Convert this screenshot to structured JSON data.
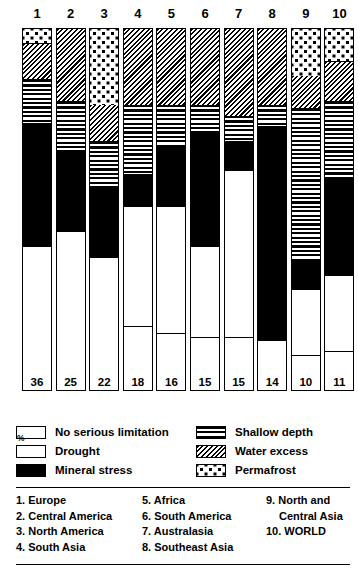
{
  "chart_data": {
    "type": "bar",
    "title": "",
    "xlabel": "",
    "ylabel": "%",
    "ylim": [
      0,
      100
    ],
    "stacked": true,
    "unit": "%",
    "categories": [
      "1",
      "2",
      "3",
      "4",
      "5",
      "6",
      "7",
      "8",
      "9",
      "10"
    ],
    "category_names": [
      "Europe",
      "Central America",
      "North America",
      "South Asia",
      "Africa",
      "South America",
      "Australasia",
      "Southeast Asia",
      "North and Central Asia",
      "WORLD"
    ],
    "series": [
      {
        "name": "Permafrost",
        "key": "permafrost",
        "pattern": "permafrost",
        "values": [
          4,
          0,
          21,
          0,
          0,
          0,
          0,
          0,
          13,
          9
        ]
      },
      {
        "name": "Water excess",
        "key": "water",
        "pattern": "water",
        "values": [
          10,
          20,
          10,
          21,
          21,
          21,
          24,
          21,
          9,
          11
        ]
      },
      {
        "name": "Shallow depth",
        "key": "shallow",
        "pattern": "shallow",
        "values": [
          12,
          14,
          13,
          19,
          11,
          8,
          7,
          6,
          42,
          21
        ]
      },
      {
        "name": "Mineral stress",
        "key": "mineral",
        "pattern": "mineral",
        "values": [
          34,
          22,
          19,
          9,
          17,
          31,
          8,
          59,
          8,
          27
        ]
      },
      {
        "name": "Drought",
        "key": "drought",
        "pattern": "drought",
        "values": [
          4,
          19,
          15,
          33,
          35,
          25,
          46,
          0,
          18,
          21
        ]
      },
      {
        "name": "No serious limitation",
        "key": "none",
        "pattern": "none",
        "values": [
          36,
          25,
          22,
          18,
          16,
          15,
          15,
          14,
          10,
          11
        ]
      }
    ],
    "bar_labels": [
      36,
      25,
      22,
      18,
      16,
      15,
      15,
      14,
      10,
      11
    ]
  },
  "legend": {
    "percent_symbol": "%",
    "left_items": [
      {
        "label": "No serious limitation",
        "pattern": "none"
      },
      {
        "label": "Drought",
        "pattern": "drought"
      },
      {
        "label": "Mineral stress",
        "pattern": "mineral"
      }
    ],
    "right_items": [
      {
        "label": "Shallow depth",
        "pattern": "shallow"
      },
      {
        "label": "Water excess",
        "pattern": "water"
      },
      {
        "label": "Permafrost",
        "pattern": "permafrost"
      }
    ]
  },
  "regions": {
    "column1": [
      "1. Europe",
      "2. Central America",
      "3. North America",
      "4. South Asia"
    ],
    "column2": [
      "5. Africa",
      "6. South America",
      "7. Australasia",
      "8. Southeast Asia"
    ],
    "column3_line1": "9. North and",
    "column3_line2": "Central Asia",
    "column3_line3": "10. WORLD"
  },
  "colors": {
    "ink": "#000000",
    "paper": "#ffffff"
  }
}
